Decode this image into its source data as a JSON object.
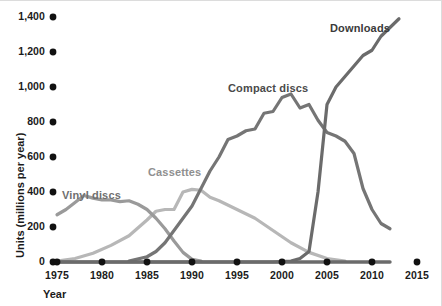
{
  "chart_data": {
    "type": "line",
    "title": "",
    "xlabel": "Year",
    "ylabel": "Units (millions per year)",
    "xlim": [
      1975,
      2015
    ],
    "ylim": [
      0,
      1400
    ],
    "grid": false,
    "legend_position": "inline-annotations",
    "x_ticks": [
      "1975",
      "1980",
      "1985",
      "1990",
      "1995",
      "2000",
      "2005",
      "2010",
      "2015"
    ],
    "x_tick_values": [
      1975,
      1980,
      1985,
      1990,
      1995,
      2000,
      2005,
      2010,
      2015
    ],
    "y_ticks": [
      "0",
      "200",
      "400",
      "600",
      "800",
      "1,000",
      "1,200",
      "1,400"
    ],
    "y_tick_values": [
      0,
      200,
      400,
      600,
      800,
      1000,
      1200,
      1400
    ],
    "series": [
      {
        "name": "Vinyl discs",
        "color": "#9a9a9a",
        "label_color": "#6f6f6f",
        "label_x": 62,
        "label_y": 189,
        "x": [
          1975,
          1976,
          1977,
          1978,
          1979,
          1980,
          1981,
          1982,
          1983,
          1984,
          1985,
          1986,
          1987,
          1988,
          1989,
          1990,
          1991
        ],
        "values": [
          270,
          300,
          340,
          380,
          365,
          355,
          355,
          345,
          350,
          330,
          300,
          250,
          190,
          120,
          55,
          15,
          5
        ]
      },
      {
        "name": "Cassettes",
        "color": "#b7b7b7",
        "label_color": "#8f8f8f",
        "label_x": 148,
        "label_y": 166,
        "x": [
          1975,
          1977,
          1979,
          1981,
          1983,
          1985,
          1986,
          1987,
          1988,
          1989,
          1990,
          1991,
          1992,
          1993,
          1995,
          1997,
          1999,
          2001,
          2003,
          2005,
          2007
        ],
        "values": [
          5,
          20,
          50,
          95,
          150,
          240,
          290,
          300,
          300,
          400,
          415,
          410,
          370,
          350,
          300,
          250,
          180,
          110,
          55,
          20,
          5
        ]
      },
      {
        "name": "Compact discs",
        "color": "#757575",
        "label_color": "#4a4a4a",
        "label_x": 228,
        "label_y": 82,
        "x": [
          1983,
          1985,
          1986,
          1987,
          1988,
          1989,
          1990,
          1991,
          1992,
          1993,
          1994,
          1995,
          1996,
          1997,
          1998,
          1999,
          2000,
          2001,
          2002,
          2003,
          2004,
          2005,
          2006,
          2007,
          2008,
          2009,
          2010,
          2011,
          2012
        ],
        "values": [
          5,
          30,
          60,
          110,
          180,
          250,
          320,
          420,
          520,
          600,
          700,
          720,
          750,
          760,
          850,
          860,
          940,
          960,
          880,
          900,
          810,
          740,
          720,
          690,
          620,
          420,
          300,
          220,
          190
        ]
      },
      {
        "name": "Downloads",
        "color": "#6b6b6b",
        "label_color": "#3a3a3a",
        "label_x": 330,
        "label_y": 22,
        "x": [
          1975,
          1999,
          2001,
          2002,
          2003,
          2004,
          2005,
          2006,
          2007,
          2008,
          2009,
          2010,
          2011,
          2012,
          2013
        ],
        "values": [
          0,
          0,
          5,
          20,
          60,
          400,
          900,
          1000,
          1060,
          1120,
          1180,
          1210,
          1290,
          1340,
          1390
        ]
      }
    ]
  },
  "axes": {
    "y_title": "Units (millions per year)",
    "x_title": "Year"
  },
  "style": {
    "tick_dot_color": "#111111",
    "baseline_color": "#6b6b6b",
    "background": "#ffffff",
    "frame_color": "#dcdcdc"
  }
}
